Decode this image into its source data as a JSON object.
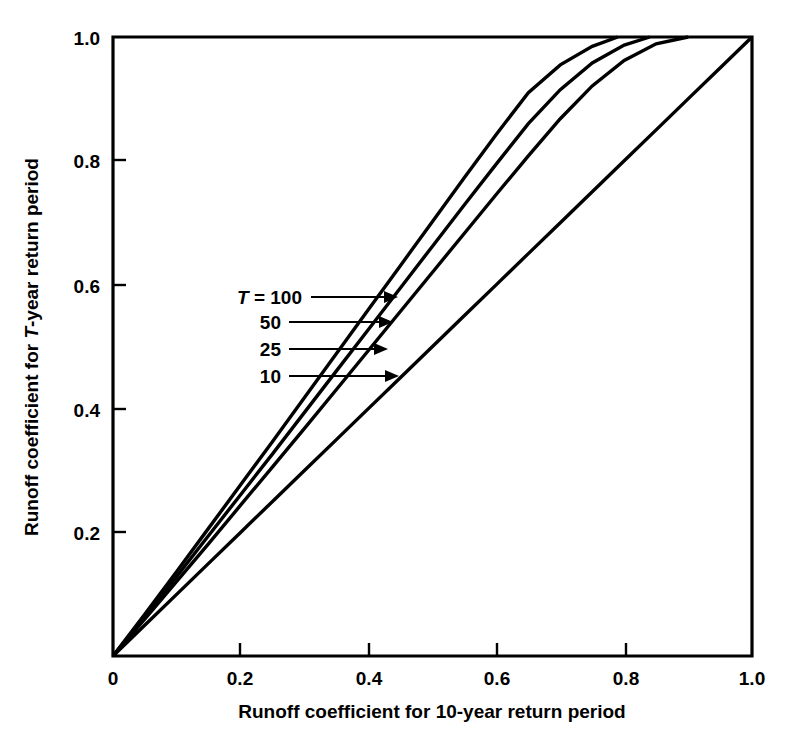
{
  "chart_data": {
    "type": "line",
    "title": "",
    "xlabel": "Runoff coefficient for 10-year return period",
    "ylabel": "Runoff coefficient for T-year return period",
    "ylabel_parts": {
      "before": "Runoff coefficient for ",
      "italic": "T",
      "after": "-year return period"
    },
    "xlim": [
      0,
      1.0
    ],
    "ylim": [
      0,
      1.0
    ],
    "grid": false,
    "legend_position": "inside-plot-annotations",
    "xticks": [
      "0",
      "0.2",
      "0.4",
      "0.6",
      "0.8",
      "1.0"
    ],
    "xtick_values": [
      0,
      0.2,
      0.4,
      0.6,
      0.8,
      1.0
    ],
    "yticks": [
      "0",
      "0.2",
      "0.4",
      "0.6",
      "0.8",
      "1.0"
    ],
    "ytick_values": [
      0,
      0.2,
      0.4,
      0.6,
      0.8,
      1.0
    ],
    "series": [
      {
        "name": "T = 100",
        "label_prefix_italic": "T",
        "label_text": "T = 100",
        "annotation": "100",
        "x": [
          0.0,
          0.05,
          0.1,
          0.15,
          0.2,
          0.25,
          0.3,
          0.35,
          0.4,
          0.45,
          0.5,
          0.55,
          0.6,
          0.65,
          0.7,
          0.75,
          0.79
        ],
        "values": [
          0.0,
          0.068,
          0.137,
          0.207,
          0.277,
          0.347,
          0.418,
          0.489,
          0.56,
          0.631,
          0.702,
          0.773,
          0.843,
          0.91,
          0.955,
          0.985,
          1.0
        ]
      },
      {
        "name": "T = 50",
        "label_text": "50",
        "annotation": "50",
        "x": [
          0.0,
          0.05,
          0.1,
          0.15,
          0.2,
          0.25,
          0.3,
          0.35,
          0.4,
          0.45,
          0.5,
          0.55,
          0.6,
          0.65,
          0.7,
          0.75,
          0.8,
          0.84
        ],
        "values": [
          0.0,
          0.064,
          0.129,
          0.195,
          0.261,
          0.327,
          0.394,
          0.461,
          0.528,
          0.595,
          0.662,
          0.729,
          0.795,
          0.86,
          0.915,
          0.958,
          0.987,
          1.0
        ]
      },
      {
        "name": "T = 25",
        "label_text": "25",
        "annotation": "25",
        "x": [
          0.0,
          0.05,
          0.1,
          0.15,
          0.2,
          0.25,
          0.3,
          0.35,
          0.4,
          0.45,
          0.5,
          0.55,
          0.6,
          0.65,
          0.7,
          0.75,
          0.8,
          0.85,
          0.9
        ],
        "values": [
          0.0,
          0.06,
          0.121,
          0.182,
          0.244,
          0.306,
          0.368,
          0.431,
          0.494,
          0.557,
          0.62,
          0.683,
          0.746,
          0.808,
          0.868,
          0.921,
          0.962,
          0.989,
          1.0
        ]
      },
      {
        "name": "T = 10",
        "label_text": "10",
        "annotation": "10",
        "x": [
          0.0,
          0.05,
          0.1,
          0.15,
          0.2,
          0.25,
          0.3,
          0.35,
          0.4,
          0.45,
          0.5,
          0.55,
          0.6,
          0.65,
          0.7,
          0.75,
          0.8,
          0.85,
          0.9,
          0.95,
          1.0
        ],
        "values": [
          0.0,
          0.05,
          0.1,
          0.15,
          0.2,
          0.25,
          0.3,
          0.35,
          0.4,
          0.45,
          0.5,
          0.55,
          0.6,
          0.65,
          0.7,
          0.75,
          0.8,
          0.85,
          0.9,
          0.95,
          1.0
        ]
      }
    ],
    "annotations": [
      {
        "text": "T = 100",
        "leader_from_x": 0.215,
        "leader_y": 0.575,
        "arrow_to_x": 0.435
      },
      {
        "text": "50",
        "leader_from_x": 0.245,
        "leader_y": 0.534,
        "arrow_to_x": 0.428
      },
      {
        "text": "25",
        "leader_from_x": 0.245,
        "leader_y": 0.49,
        "arrow_to_x": 0.42
      },
      {
        "text": "10",
        "leader_from_x": 0.245,
        "leader_y": 0.447,
        "arrow_to_x": 0.432
      }
    ]
  },
  "axis": {
    "x_title": "Runoff coefficient for 10-year return period",
    "y_title_before": "Runoff coefficient for ",
    "y_title_italic": "T",
    "y_title_after": "-year return period"
  },
  "ticks": {
    "x": [
      "0",
      "0.2",
      "0.4",
      "0.6",
      "0.8",
      "1.0"
    ],
    "y": [
      "0",
      "0.2",
      "0.4",
      "0.6",
      "0.8",
      "1.0"
    ]
  },
  "labels": {
    "t100_prefix": "T",
    "t100_rest": " = 100",
    "t50": "50",
    "t25": "25",
    "t10": "10"
  },
  "colors": {
    "background": "#ffffff",
    "ink": "#000000"
  }
}
